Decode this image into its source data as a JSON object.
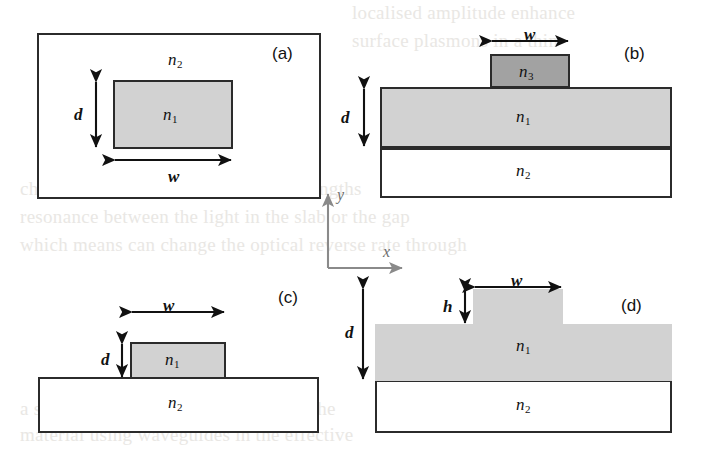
{
  "figure": {
    "background_color": "#ffffff",
    "core_color": "#d2d2d2",
    "strip_color": "#a2a2a2",
    "cladding_color": "#ffffff",
    "line_color": "#2b2b2b",
    "axis_color": "#6d6d6d"
  },
  "ghost": {
    "line1": "localised amplitude enhance",
    "line2": "surface plasmons in a thin",
    "line3": "channel waveguide, which the wavelengths",
    "line4": "resonance between the light in the slab or the gap",
    "line5": "which means can change the optical reverse rate through",
    "line6": "a silica or silicon slab waveguide on the",
    "line7": "material using waveguides in the effective"
  },
  "axes": {
    "x_label": "x",
    "y_label": "y"
  },
  "panels": [
    {
      "id": "a",
      "letter": "(a)",
      "type": "buried-rectangular-waveguide",
      "regions": [
        {
          "name": "cladding",
          "label": "n",
          "subscript": "2",
          "fill": "#ffffff"
        },
        {
          "name": "core",
          "label": "n",
          "subscript": "1",
          "fill": "#d2d2d2"
        }
      ],
      "dimensions": [
        {
          "symbol": "d",
          "orientation": "vertical",
          "measures": "core height"
        },
        {
          "symbol": "w",
          "orientation": "horizontal",
          "measures": "core width"
        }
      ]
    },
    {
      "id": "b",
      "letter": "(b)",
      "type": "strip-loaded-waveguide",
      "regions": [
        {
          "name": "loading-strip",
          "label": "n",
          "subscript": "3",
          "fill": "#a2a2a2"
        },
        {
          "name": "guiding-film",
          "label": "n",
          "subscript": "1",
          "fill": "#d2d2d2"
        },
        {
          "name": "substrate",
          "label": "n",
          "subscript": "2",
          "fill": "#ffffff"
        }
      ],
      "dimensions": [
        {
          "symbol": "w",
          "orientation": "horizontal",
          "measures": "strip width"
        },
        {
          "symbol": "d",
          "orientation": "vertical",
          "measures": "film thickness"
        }
      ]
    },
    {
      "id": "c",
      "letter": "(c)",
      "type": "ridge-waveguide",
      "regions": [
        {
          "name": "ridge-core",
          "label": "n",
          "subscript": "1",
          "fill": "#d2d2d2"
        },
        {
          "name": "substrate",
          "label": "n",
          "subscript": "2",
          "fill": "#ffffff"
        }
      ],
      "dimensions": [
        {
          "symbol": "w",
          "orientation": "horizontal",
          "measures": "ridge width"
        },
        {
          "symbol": "d",
          "orientation": "vertical",
          "measures": "ridge height"
        }
      ]
    },
    {
      "id": "d",
      "letter": "(d)",
      "type": "rib-waveguide",
      "regions": [
        {
          "name": "rib-core",
          "label": "n",
          "subscript": "1",
          "fill": "#d2d2d2"
        },
        {
          "name": "substrate",
          "label": "n",
          "subscript": "2",
          "fill": "#ffffff"
        }
      ],
      "dimensions": [
        {
          "symbol": "w",
          "orientation": "horizontal",
          "measures": "rib width"
        },
        {
          "symbol": "h",
          "orientation": "vertical",
          "measures": "rib height above slab"
        },
        {
          "symbol": "d",
          "orientation": "vertical",
          "measures": "total core thickness"
        }
      ]
    }
  ]
}
